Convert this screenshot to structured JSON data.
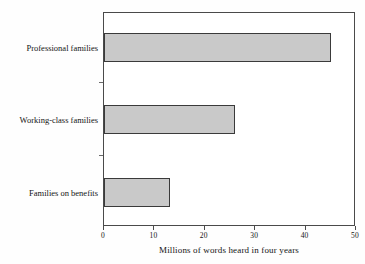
{
  "chart_data": {
    "type": "bar",
    "orientation": "horizontal",
    "title": "",
    "subtitle": "",
    "categories": [
      "Professional families",
      "Working-class families",
      "Families on benefits"
    ],
    "values": [
      45,
      26,
      13
    ],
    "series": [
      {
        "name": "Millions of words heard in four years",
        "values": [
          45,
          26,
          13
        ]
      }
    ],
    "xlabel": "Millions of words heard in four years",
    "ylabel": "",
    "xlim": [
      0,
      50
    ],
    "xticks": [
      0,
      10,
      20,
      30,
      40,
      50
    ],
    "xtick_labels": [
      "0",
      "10",
      "20",
      "30",
      "40",
      "50"
    ],
    "grid": false,
    "legend": false,
    "legend_position": "none",
    "bar_fill_color": "#c9c9c9",
    "bar_edge_color": "#3a3a3a",
    "axis_color": "#4a4a4a",
    "background_color": "#ffffff"
  },
  "axis": {
    "x_title": "Millions of words heard in four years"
  }
}
